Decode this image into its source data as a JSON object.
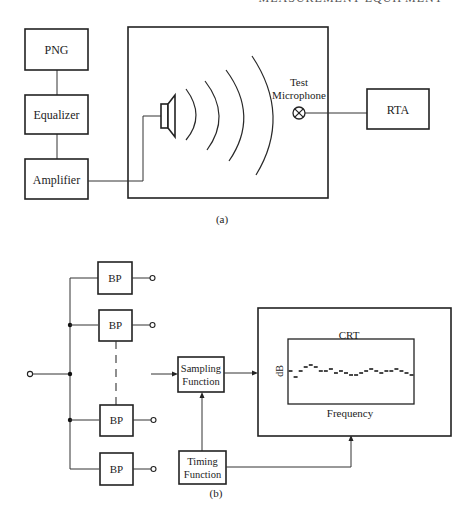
{
  "page": {
    "running_head": "MEASUREMENT EQUIPMENT"
  },
  "figure_a": {
    "caption": "(a)",
    "blocks": {
      "png": "PNG",
      "equalizer": "Equalizer",
      "amplifier": "Amplifier",
      "rta": "RTA"
    },
    "microphone_label_line1": "Test",
    "microphone_label_line2": "Microphone",
    "icons": {
      "speaker": "loudspeaker-icon",
      "microphone": "microphone-symbol-icon",
      "sound_waves": "sound-wave-arcs"
    }
  },
  "figure_b": {
    "caption": "(b)",
    "filters": [
      "BP",
      "BP",
      "BP",
      "BP"
    ],
    "sampling_line1": "Sampling",
    "sampling_line2": "Function",
    "timing_line1": "Timing",
    "timing_line2": "Function",
    "crt": {
      "title": "CRT",
      "y_axis_label": "dB",
      "x_axis_label": "Frequency"
    }
  },
  "chart_data": {
    "type": "scatter",
    "title": "CRT",
    "xlabel": "Frequency",
    "ylabel": "dB",
    "note": "Stepped dash trace of band levels (relative screen units, 0 = reference dB line)",
    "x": [
      1,
      2,
      3,
      4,
      5,
      6,
      7,
      8,
      9,
      10,
      11,
      12,
      13,
      14,
      15,
      16,
      17,
      18,
      19,
      20,
      21,
      22,
      23,
      24,
      25
    ],
    "values": [
      0,
      -3,
      0,
      2,
      3,
      2,
      0,
      0,
      1,
      -1,
      0,
      -1,
      -2,
      -2,
      -1,
      0,
      1,
      0,
      -1,
      0,
      0,
      1,
      0,
      -1,
      -2
    ]
  }
}
